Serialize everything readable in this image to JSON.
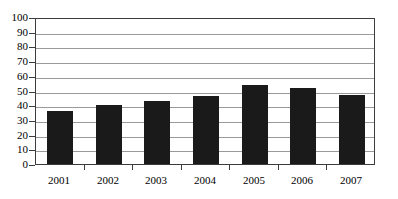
{
  "chart_data": {
    "type": "bar",
    "title": "",
    "subtitle": "",
    "xlabel": "",
    "ylabel": "",
    "categories": [
      "2001",
      "2002",
      "2003",
      "2004",
      "2005",
      "2006",
      "2007"
    ],
    "values": [
      36,
      40,
      43,
      46,
      54,
      52,
      47
    ],
    "series": [
      {
        "name": "",
        "values": [
          36,
          40,
          43,
          46,
          54,
          52,
          47
        ]
      }
    ],
    "ylim": [
      0,
      100
    ],
    "y_ticks": [
      0,
      10,
      20,
      30,
      40,
      50,
      60,
      70,
      80,
      90,
      100
    ],
    "y_tick_labels": [
      "0",
      "10",
      "20",
      "30",
      "40",
      "50",
      "60",
      "70",
      "80",
      "90",
      "100"
    ],
    "grid": true,
    "grid_axis": "y",
    "legend": false,
    "legend_position": "none",
    "bar_color": "#1a1a1a",
    "grid_color": "#9a9a9a",
    "frame_color": "#3c3c3c",
    "background_color": "#ffffff",
    "annotations": []
  }
}
